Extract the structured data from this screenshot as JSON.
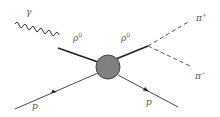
{
  "diagram": {
    "type": "feynman-diagram",
    "colors": {
      "line": "#222222",
      "dashed": "#555555",
      "blob_fill": "#808080",
      "blob_stroke": "#444444",
      "label": "#555555"
    },
    "labels": {
      "photon": "γ",
      "rho_left": "ρ",
      "rho_left_sup": "0",
      "rho_right": "ρ",
      "rho_right_sup": "0",
      "pi_plus": "π",
      "pi_plus_sup": "+",
      "pi_minus": "π",
      "pi_minus_sup": "−",
      "proton_in": "p",
      "proton_out": "p"
    },
    "particles": [
      {
        "name": "photon",
        "line": "wavy",
        "role": "incoming"
      },
      {
        "name": "rho0",
        "line": "thick-solid",
        "role": "intermediate"
      },
      {
        "name": "rho0",
        "line": "thick-solid",
        "role": "intermediate"
      },
      {
        "name": "pi+",
        "line": "dashed",
        "role": "outgoing"
      },
      {
        "name": "pi-",
        "line": "dashed",
        "role": "outgoing"
      },
      {
        "name": "proton",
        "line": "solid-arrow",
        "role": "incoming"
      },
      {
        "name": "proton",
        "line": "solid-arrow",
        "role": "outgoing"
      }
    ]
  }
}
